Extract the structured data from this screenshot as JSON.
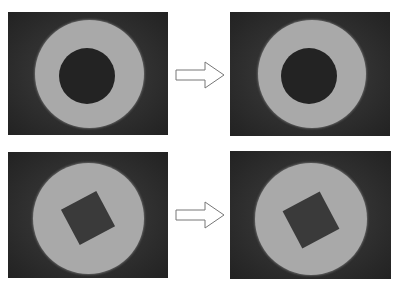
{
  "figure": {
    "rows": [
      {
        "name": "ring-row",
        "before": {
          "shape": "annulus",
          "outer_color": "#a9a9a9",
          "inner_color": "#232323"
        },
        "arrow": {
          "icon": "right-arrow-icon",
          "direction": "right"
        },
        "after": {
          "shape": "annulus",
          "outer_color": "#a9a9a9",
          "inner_color": "#232323"
        }
      },
      {
        "name": "square-hole-row",
        "before": {
          "shape": "disk-with-square-hole",
          "outer_color": "#a9a9a9",
          "inner_color": "#3a3a3a"
        },
        "arrow": {
          "icon": "right-arrow-icon",
          "direction": "right"
        },
        "after": {
          "shape": "disk-with-square-hole",
          "outer_color": "#a9a9a9",
          "inner_color": "#3a3a3a"
        }
      }
    ],
    "background_color": "#2b2b2b"
  }
}
